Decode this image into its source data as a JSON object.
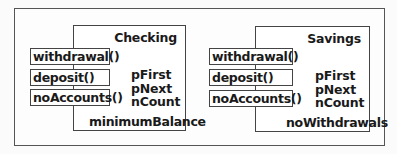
{
  "diagram": {
    "classes": [
      {
        "name": "Checking",
        "methods": [
          "withdrawal()",
          "deposit()",
          "noAccounts()"
        ],
        "fields": [
          "pFirst",
          "pNext",
          "nCount"
        ],
        "extra_field": "minimumBalance"
      },
      {
        "name": "Savings",
        "methods": [
          "withdrawal()",
          "deposit()",
          "noAccounts()"
        ],
        "fields": [
          "pFirst",
          "pNext",
          "nCount"
        ],
        "extra_field": "noWithdrawals"
      }
    ]
  }
}
